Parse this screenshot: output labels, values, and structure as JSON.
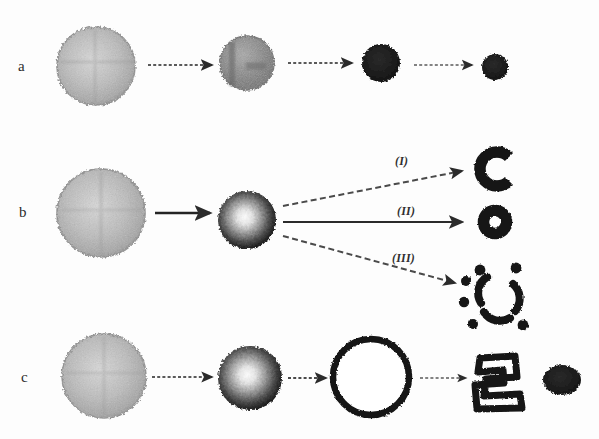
{
  "figure": {
    "background_color": "#fdfdfd",
    "width": 599,
    "height": 439,
    "ink_color": "#1a1a1a",
    "arrow_color": "#4a4a4a"
  },
  "rows": [
    {
      "id": "a",
      "label": "a",
      "label_x": 18,
      "label_y": 59,
      "description": "Progressive shrinkage and densification of a solid particle",
      "stages": [
        {
          "name": "light-sphere",
          "cx": 96,
          "cy": 66,
          "r": 39,
          "fill": "#b9b9b9",
          "kind": "speckled-sphere"
        },
        {
          "name": "gray-sphere",
          "cx": 247,
          "cy": 63,
          "r": 27,
          "fill": "#8e8e8e",
          "kind": "mottled-sphere"
        },
        {
          "name": "dark-particle",
          "cx": 381,
          "cy": 63,
          "r": 19,
          "fill": "#1d1d1d",
          "kind": "solid-blob"
        },
        {
          "name": "small-dark-particle",
          "cx": 495,
          "cy": 67,
          "r": 13,
          "fill": "#1d1d1d",
          "kind": "solid-blob"
        }
      ],
      "arrows": [
        {
          "name": "arrow-a1",
          "x1": 148,
          "y1": 65,
          "x2": 212,
          "y2": 65,
          "style": "dashed"
        },
        {
          "name": "arrow-a2",
          "x1": 288,
          "y1": 63,
          "x2": 352,
          "y2": 63,
          "style": "dashed"
        },
        {
          "name": "arrow-a3",
          "x1": 414,
          "y1": 65,
          "x2": 472,
          "y2": 65,
          "style": "dashed"
        }
      ]
    },
    {
      "id": "b",
      "label": "b",
      "label_x": 19,
      "label_y": 205,
      "description": "Core-shell intermediate branching into three hollow products",
      "stages": [
        {
          "name": "light-sphere",
          "cx": 101,
          "cy": 213,
          "r": 44,
          "fill": "#b9b9b9",
          "kind": "speckled-sphere"
        },
        {
          "name": "core-shell-sphere",
          "cx": 247,
          "cy": 220,
          "r": 29,
          "fill": "#3a3a3a",
          "kind": "core-shell-sphere"
        }
      ],
      "arrows": [
        {
          "name": "arrow-b1",
          "x1": 155,
          "y1": 213,
          "x2": 210,
          "y2": 213,
          "style": "solid"
        }
      ],
      "branches": [
        {
          "name": "branch-I",
          "label": "(I)",
          "label_x": 395,
          "label_y": 155,
          "style": "dashed",
          "x1": 283,
          "y1": 206,
          "x2": 462,
          "y2": 171,
          "product": {
            "name": "c-shape-particle",
            "kind": "c-shape",
            "cx": 495,
            "cy": 169,
            "r": 17
          }
        },
        {
          "name": "branch-II",
          "label": "(II)",
          "label_x": 397,
          "label_y": 205,
          "style": "solid",
          "x1": 283,
          "y1": 222,
          "x2": 462,
          "y2": 222,
          "product": {
            "name": "ring-particle",
            "kind": "ring",
            "cx": 495,
            "cy": 222,
            "r": 17
          }
        },
        {
          "name": "branch-III",
          "label": "(III)",
          "label_x": 392,
          "label_y": 252,
          "style": "dashed",
          "x1": 283,
          "y1": 236,
          "x2": 455,
          "y2": 283,
          "product": {
            "name": "fragmented-ring-particle",
            "kind": "fragments",
            "cx": 497,
            "cy": 295,
            "r": 28
          }
        }
      ]
    },
    {
      "id": "c",
      "label": "c",
      "label_x": 21,
      "label_y": 370,
      "description": "Core-shell sphere expands to a hollow shell that collapses into a crumpled shell and dense residue",
      "stages": [
        {
          "name": "light-sphere",
          "cx": 104,
          "cy": 376,
          "r": 42,
          "fill": "#b9b9b9",
          "kind": "speckled-sphere"
        },
        {
          "name": "core-shell-sphere",
          "cx": 250,
          "cy": 378,
          "r": 32,
          "fill": "#3a3a3a",
          "kind": "core-shell-sphere"
        },
        {
          "name": "hollow-ring",
          "cx": 371,
          "cy": 377,
          "r": 41,
          "kind": "hollow-ring"
        },
        {
          "name": "collapsed-shell",
          "cx": 499,
          "cy": 380,
          "r": 27,
          "kind": "crumpled"
        },
        {
          "name": "dense-blob",
          "cx": 562,
          "cy": 380,
          "r": 18,
          "fill": "#1d1d1d",
          "kind": "solid-blob"
        }
      ],
      "arrows": [
        {
          "name": "arrow-c1",
          "x1": 152,
          "y1": 377,
          "x2": 212,
          "y2": 377,
          "style": "dashed"
        },
        {
          "name": "arrow-c2",
          "x1": 288,
          "y1": 378,
          "x2": 326,
          "y2": 378,
          "style": "dashed"
        },
        {
          "name": "arrow-c3",
          "x1": 420,
          "y1": 378,
          "x2": 466,
          "y2": 378,
          "style": "dashed"
        }
      ]
    }
  ]
}
